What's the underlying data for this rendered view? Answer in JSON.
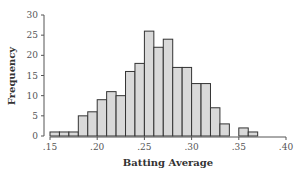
{
  "chart_data": {
    "type": "bar",
    "title": "",
    "xlabel": "Batting Average",
    "ylabel": "Frequency",
    "bin_width": 0.01,
    "bin_starts": [
      0.15,
      0.16,
      0.17,
      0.18,
      0.19,
      0.2,
      0.21,
      0.22,
      0.23,
      0.24,
      0.25,
      0.26,
      0.27,
      0.28,
      0.29,
      0.3,
      0.31,
      0.32,
      0.33,
      0.34,
      0.35,
      0.36
    ],
    "values": [
      1,
      1,
      1,
      5,
      6,
      9,
      11,
      10,
      16,
      18,
      26,
      22,
      24,
      17,
      17,
      13,
      13,
      7,
      3,
      0,
      2,
      1
    ],
    "xlim": [
      0.15,
      0.4
    ],
    "ylim": [
      0,
      30
    ],
    "xticks": [
      ".15",
      ".20",
      ".25",
      ".30",
      ".35",
      ".40"
    ],
    "yticks": [
      "0",
      "5",
      "10",
      "15",
      "20",
      "25",
      "30"
    ],
    "grid": false,
    "legend": null,
    "bar_fill": "#d9d9d9",
    "bar_stroke": "#333333"
  }
}
